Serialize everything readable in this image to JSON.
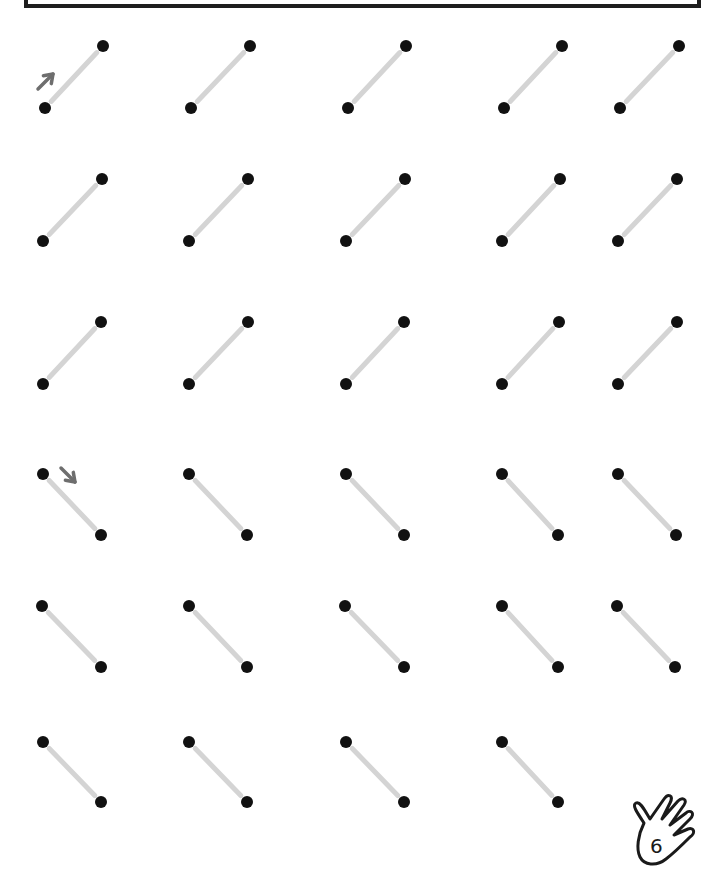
{
  "worksheet": {
    "title_box": "",
    "page_number": "6",
    "colors": {
      "dot": "#111111",
      "trace_line": "#d4d4d4",
      "arrow": "#6e6e6e",
      "frame": "#1e1e1e"
    },
    "sections": [
      {
        "direction": "up-right",
        "rows": [
          {
            "y_low": 108,
            "y_high": 46,
            "x_left": [
              45,
              191,
              348,
              504,
              620
            ],
            "x_right": [
              103,
              250,
              406,
              562,
              679
            ]
          },
          {
            "y_low": 241,
            "y_high": 179,
            "x_left": [
              43,
              189,
              346,
              502,
              618
            ],
            "x_right": [
              102,
              248,
              405,
              560,
              677
            ]
          },
          {
            "y_low": 384,
            "y_high": 322,
            "x_left": [
              43,
              189,
              346,
              502,
              618
            ],
            "x_right": [
              101,
              248,
              404,
              559,
              677
            ]
          }
        ]
      },
      {
        "direction": "down-right",
        "rows": [
          {
            "y_high": 474,
            "y_low": 535,
            "x_left": [
              43,
              189,
              346,
              502,
              618
            ],
            "x_right": [
              101,
              247,
              404,
              558,
              676
            ]
          },
          {
            "y_high": 606,
            "y_low": 667,
            "x_left": [
              42,
              189,
              345,
              502,
              617
            ],
            "x_right": [
              101,
              247,
              404,
              558,
              675
            ]
          },
          {
            "y_high": 742,
            "y_low": 802,
            "x_left": [
              43,
              189,
              346,
              502
            ],
            "x_right": [
              101,
              247,
              404,
              558
            ]
          }
        ]
      }
    ],
    "arrows": [
      {
        "name": "arrow-up-right-icon",
        "x1": 38,
        "y1": 89,
        "x2": 53,
        "y2": 74
      },
      {
        "name": "arrow-down-right-icon",
        "x1": 61,
        "y1": 468,
        "x2": 75,
        "y2": 482
      }
    ]
  }
}
